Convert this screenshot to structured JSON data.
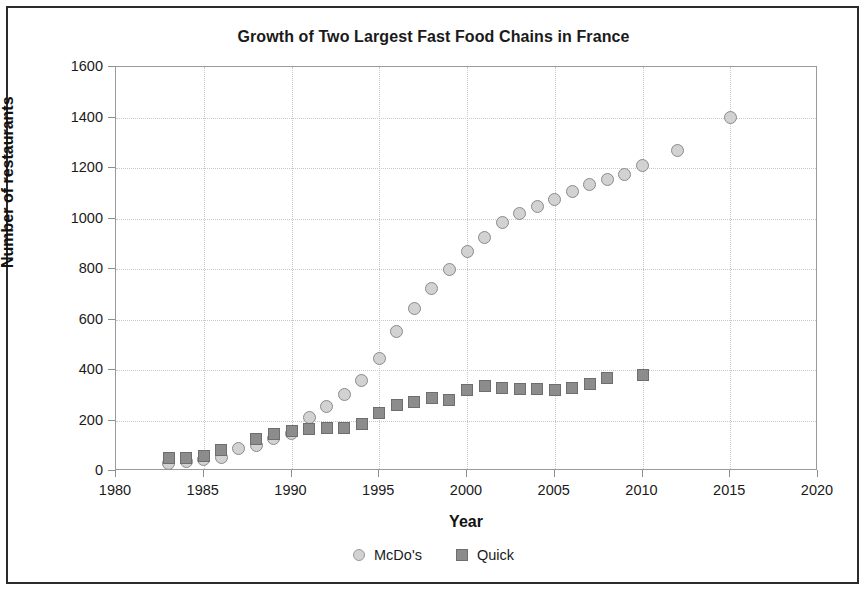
{
  "chart_data": {
    "type": "scatter",
    "title": "Growth of Two Largest Fast Food Chains in France",
    "xlabel": "Year",
    "ylabel": "Number of restaurants",
    "xlim": [
      1980,
      2020
    ],
    "ylim": [
      0,
      1600
    ],
    "xticks": [
      1980,
      1985,
      1990,
      1995,
      2000,
      2005,
      2010,
      2015,
      2020
    ],
    "yticks": [
      0,
      200,
      400,
      600,
      800,
      1000,
      1200,
      1400,
      1600
    ],
    "grid": true,
    "legend_position": "bottom",
    "series": [
      {
        "name": "McDo's",
        "marker": "circle",
        "color": "#d2d2d2",
        "edge_color": "#8a8a8a",
        "points": [
          {
            "x": 1983,
            "y": 30
          },
          {
            "x": 1984,
            "y": 38
          },
          {
            "x": 1985,
            "y": 45
          },
          {
            "x": 1986,
            "y": 55
          },
          {
            "x": 1987,
            "y": 88
          },
          {
            "x": 1988,
            "y": 100
          },
          {
            "x": 1989,
            "y": 128
          },
          {
            "x": 1990,
            "y": 150
          },
          {
            "x": 1991,
            "y": 210
          },
          {
            "x": 1992,
            "y": 255
          },
          {
            "x": 1993,
            "y": 303
          },
          {
            "x": 1994,
            "y": 360
          },
          {
            "x": 1995,
            "y": 447
          },
          {
            "x": 1996,
            "y": 552
          },
          {
            "x": 1997,
            "y": 645
          },
          {
            "x": 1998,
            "y": 722
          },
          {
            "x": 1999,
            "y": 800
          },
          {
            "x": 2000,
            "y": 871
          },
          {
            "x": 2001,
            "y": 923
          },
          {
            "x": 2002,
            "y": 984
          },
          {
            "x": 2003,
            "y": 1018
          },
          {
            "x": 2004,
            "y": 1048
          },
          {
            "x": 2005,
            "y": 1075
          },
          {
            "x": 2006,
            "y": 1105
          },
          {
            "x": 2007,
            "y": 1134
          },
          {
            "x": 2008,
            "y": 1154
          },
          {
            "x": 2009,
            "y": 1173
          },
          {
            "x": 2010,
            "y": 1210
          },
          {
            "x": 2012,
            "y": 1268
          },
          {
            "x": 2015,
            "y": 1400
          }
        ]
      },
      {
        "name": "Quick",
        "marker": "square",
        "color": "#8c8c8c",
        "edge_color": "#6e6e6e",
        "points": [
          {
            "x": 1983,
            "y": 50
          },
          {
            "x": 1984,
            "y": 52
          },
          {
            "x": 1985,
            "y": 60
          },
          {
            "x": 1986,
            "y": 85
          },
          {
            "x": 1988,
            "y": 125
          },
          {
            "x": 1989,
            "y": 145
          },
          {
            "x": 1990,
            "y": 160
          },
          {
            "x": 1991,
            "y": 168
          },
          {
            "x": 1992,
            "y": 172
          },
          {
            "x": 1993,
            "y": 170
          },
          {
            "x": 1994,
            "y": 188
          },
          {
            "x": 1995,
            "y": 228
          },
          {
            "x": 1996,
            "y": 262
          },
          {
            "x": 1997,
            "y": 275
          },
          {
            "x": 1998,
            "y": 288
          },
          {
            "x": 1999,
            "y": 280
          },
          {
            "x": 2000,
            "y": 320
          },
          {
            "x": 2001,
            "y": 338
          },
          {
            "x": 2002,
            "y": 330
          },
          {
            "x": 2003,
            "y": 325
          },
          {
            "x": 2004,
            "y": 323
          },
          {
            "x": 2005,
            "y": 320
          },
          {
            "x": 2006,
            "y": 330
          },
          {
            "x": 2007,
            "y": 345
          },
          {
            "x": 2008,
            "y": 368
          },
          {
            "x": 2010,
            "y": 380
          }
        ]
      }
    ]
  }
}
